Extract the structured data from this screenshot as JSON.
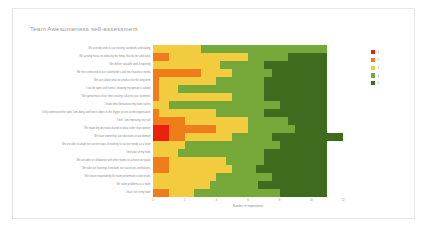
{
  "card": {
    "title": "Team Awesomeness self-assessment"
  },
  "legend": {
    "position": "right",
    "entries": [
      {
        "label": "1",
        "color": "#e8220c"
      },
      {
        "label": "2",
        "color": "#ef7d1a"
      },
      {
        "label": "3",
        "color": "#f2cb3e"
      },
      {
        "label": "4",
        "color": "#76a83a"
      },
      {
        "label": "5",
        "color": "#3e6b1e"
      }
    ]
  },
  "chart_data": {
    "type": "bar",
    "orientation": "horizontal",
    "stacked": true,
    "title": "Team Awesomeness self-assessment",
    "xlabel": "Number of respondents",
    "ylabel": "",
    "xlim": [
      0,
      12
    ],
    "xticks": [
      0,
      2,
      4,
      6,
      8,
      10,
      12
    ],
    "grid": false,
    "legend_entries": [
      "1",
      "2",
      "3",
      "4",
      "5"
    ],
    "colors": [
      "#e8220c",
      "#ef7d1a",
      "#f2cb3e",
      "#76a83a",
      "#3e6b1e"
    ],
    "categories": [
      "We actively seek to use existing standards and tooling",
      "We actively focus on reducing the things that do not add value",
      "We deliver valuable work frequently",
      "We feel connected to our stakeholders and their business needs",
      "We care about what we produce for the long term",
      "I can be open and honest, knowing my opinion is valued",
      "We spend most of our time creating value for our customers",
      "I know what behaviours my team values",
      "I fully understand the work I am doing and how it aligns to the bigger picture at the organisation",
      "I feel I am improving my craft",
      "We make big decisions based on data rather than opinion",
      "We have ownership over decisions in our domain",
      "We are able to adapt our current ways of working to suit our needs as a team",
      "I feel part of my team",
      "We are able to collaborate with other teams to achieve our goals",
      "We take our learnings from both our successes and failures",
      "We share responsibility for team performance and results",
      "We solve problems as a team",
      "I have fun in my team"
    ],
    "series": [
      {
        "name": "1",
        "values": [
          0,
          0,
          0,
          0,
          0,
          0,
          0,
          0,
          0,
          0,
          1,
          1,
          0,
          0,
          0,
          0,
          0,
          0,
          0
        ]
      },
      {
        "name": "2",
        "values": [
          0,
          1,
          0,
          3,
          0.4,
          0.4,
          0.4,
          0,
          0.4,
          2,
          3,
          1,
          0,
          0,
          1,
          1,
          0,
          0,
          1
        ]
      },
      {
        "name": "3",
        "values": [
          3,
          5,
          4.2,
          2,
          3.6,
          1.2,
          4.6,
          1,
          3.6,
          4,
          2,
          3,
          2,
          1.6,
          3.6,
          4,
          4,
          3.6,
          1.6
        ]
      },
      {
        "name": "4",
        "values": [
          8,
          2.5,
          2.8,
          2.5,
          3,
          5.4,
          2,
          7,
          3,
          2.5,
          3,
          2.5,
          6,
          5.4,
          2.4,
          1.5,
          3.5,
          3,
          5.4
        ]
      },
      {
        "name": "5",
        "values": [
          0,
          2.5,
          4,
          3.5,
          4,
          4,
          4,
          3,
          4,
          2.5,
          2,
          4.5,
          3,
          4,
          4,
          4.5,
          3.5,
          4.4,
          3
        ]
      }
    ],
    "row_total": 11
  }
}
